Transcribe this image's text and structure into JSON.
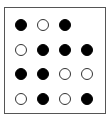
{
  "diagram": {
    "type": "dot-grid",
    "rows": 4,
    "cols": 4,
    "legend": {
      "filled": "black-dot",
      "hollow": "white-dot",
      "empty": "no-dot"
    },
    "colors": {
      "filled": "#000000",
      "hollow": "#ffffff",
      "border": "#555555"
    },
    "grid": [
      [
        "filled",
        "hollow",
        "filled",
        "empty"
      ],
      [
        "hollow",
        "filled",
        "filled",
        "filled"
      ],
      [
        "filled",
        "filled",
        "hollow",
        "hollow"
      ],
      [
        "hollow",
        "filled",
        "hollow",
        "filled"
      ]
    ]
  }
}
